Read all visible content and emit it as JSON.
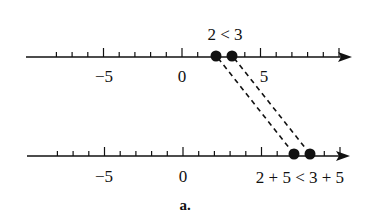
{
  "figure": {
    "caption": "a.",
    "top_line": {
      "inequality_label": "2 < 3",
      "tick_labels": [
        {
          "value": -5,
          "text": "−5"
        },
        {
          "value": 0,
          "text": "0"
        },
        {
          "value": 5,
          "text": "5"
        }
      ],
      "points": [
        2,
        3
      ],
      "range": [
        -8,
        10
      ]
    },
    "bottom_line": {
      "inequality_label": "2 + 5 < 3 + 5",
      "tick_labels": [
        {
          "value": -5,
          "text": "−5"
        },
        {
          "value": 0,
          "text": "0"
        }
      ],
      "points": [
        7,
        8
      ],
      "range": [
        -8,
        10
      ]
    },
    "connectors": [
      {
        "from": 2,
        "to": 7,
        "style": "dashed"
      },
      {
        "from": 3,
        "to": 8,
        "style": "dashed"
      }
    ],
    "colors": {
      "ink": "#111111",
      "background": "#ffffff"
    }
  }
}
